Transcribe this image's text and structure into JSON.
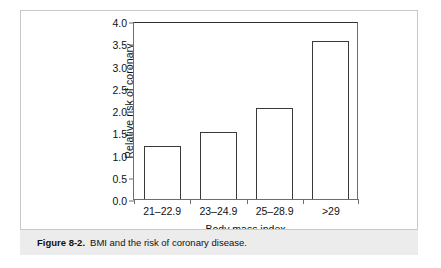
{
  "figure": {
    "caption_label": "Figure 8-2.",
    "caption_text": "BMI and the risk of coronary disease."
  },
  "chart_data": {
    "type": "bar",
    "title": "",
    "subtitle": "",
    "xlabel": "Body mass index",
    "ylabel": "Relative risk of coronary heart disease",
    "ylabel_lines": [
      "Relative risk of coronary",
      "heart disease"
    ],
    "categories": [
      "21–22.9",
      "23–24.9",
      "25–28.9",
      ">29"
    ],
    "values": [
      1.2,
      1.5,
      2.05,
      3.55
    ],
    "series": [
      {
        "name": "Relative risk of coronary heart disease",
        "values": [
          1.2,
          1.5,
          2.05,
          3.55
        ]
      }
    ],
    "ylim": [
      0.0,
      4.0
    ],
    "ytick_labels": [
      "0.0",
      "0.5",
      "1.0",
      "1.5",
      "2.0",
      "2.5",
      "3.0",
      "3.5",
      "4.0"
    ],
    "ytick_values": [
      0.0,
      0.5,
      1.0,
      1.5,
      2.0,
      2.5,
      3.0,
      3.5,
      4.0
    ],
    "grid": false,
    "legend": false,
    "legend_position": "none",
    "bar_fill_color": "#ffffff",
    "bar_edge_color": "#3a3a3a",
    "axis_color": "#6e6e6e"
  }
}
